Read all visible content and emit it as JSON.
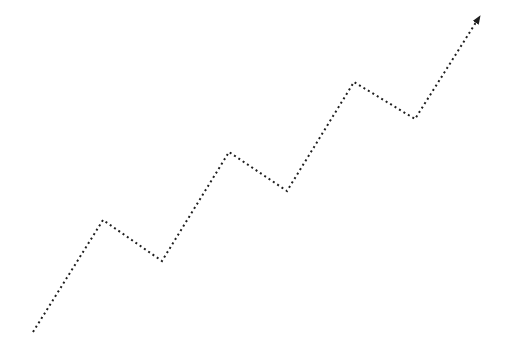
{
  "diagram": {
    "background_color": "#ffffff",
    "width": 514,
    "height": 362,
    "line": {
      "color": "#1f1f1f",
      "style": "dotted",
      "dot_size": 2,
      "dot_gap": 3.2,
      "points": [
        [
          33,
          332
        ],
        [
          103,
          220
        ],
        [
          162,
          261
        ],
        [
          229,
          152
        ],
        [
          287,
          191
        ],
        [
          354,
          82
        ],
        [
          415,
          119
        ],
        [
          480,
          16
        ]
      ]
    },
    "arrowhead": {
      "shape": "filled-triangle",
      "color": "#1f1f1f",
      "position": "end",
      "length": 9,
      "half_width": 3.5
    }
  }
}
